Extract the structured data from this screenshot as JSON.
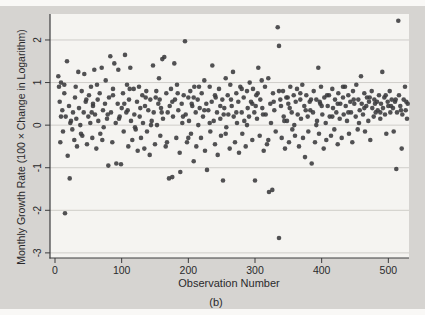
{
  "figure": {
    "caption": "(b)"
  },
  "chart_data": {
    "type": "scatter",
    "title": "",
    "xlabel": "Observation Number",
    "ylabel": "Monthly Growth Rate (100 × Change in Logarithm)",
    "xlim": [
      -7.5,
      531
    ],
    "ylim": [
      -3.12,
      2.61
    ],
    "xticks": [
      0,
      100,
      200,
      300,
      400,
      500
    ],
    "yticks": [
      2,
      1,
      0,
      -1,
      -2,
      -3
    ],
    "grid": "horizontal-only",
    "legend_position": "none",
    "marker": "filled-circle",
    "marker_color": "#3a3a3c",
    "axis_color": "#3c3c3e",
    "gridline_color": "#cfcdc9",
    "scan_gray": "#d6d4d1",
    "plot_bg": "#f5f4f1",
    "points": [
      [
        5,
        1.15
      ],
      [
        6,
        0.9
      ],
      [
        8,
        -0.4
      ],
      [
        9,
        1.0
      ],
      [
        11,
        0.35
      ],
      [
        12,
        -0.15
      ],
      [
        14,
        0.95
      ],
      [
        15,
        -2.07
      ],
      [
        16,
        0.2
      ],
      [
        18,
        1.5
      ],
      [
        19,
        -0.72
      ],
      [
        21,
        0.45
      ],
      [
        22,
        -1.25
      ],
      [
        24,
        0.1
      ],
      [
        26,
        -0.1
      ],
      [
        27,
        0.3
      ],
      [
        29,
        -0.35
      ],
      [
        30,
        0.65
      ],
      [
        32,
        0.15
      ],
      [
        33,
        -0.5
      ],
      [
        35,
        1.25
      ],
      [
        36,
        0.4
      ],
      [
        38,
        0.0
      ],
      [
        40,
        0.8
      ],
      [
        41,
        -0.25
      ],
      [
        43,
        0.3
      ],
      [
        44,
        1.2
      ],
      [
        46,
        0.55
      ],
      [
        48,
        -0.45
      ],
      [
        50,
        0.2
      ],
      [
        51,
        0.7
      ],
      [
        53,
        0.05
      ],
      [
        54,
        0.9
      ],
      [
        56,
        -0.3
      ],
      [
        57,
        0.45
      ],
      [
        59,
        1.3
      ],
      [
        60,
        0.25
      ],
      [
        62,
        -0.55
      ],
      [
        64,
        0.6
      ],
      [
        65,
        0.1
      ],
      [
        67,
        0.75
      ],
      [
        68,
        -0.2
      ],
      [
        70,
        1.35
      ],
      [
        72,
        0.35
      ],
      [
        73,
        -0.05
      ],
      [
        75,
        0.5
      ],
      [
        76,
        1.05
      ],
      [
        78,
        0.15
      ],
      [
        80,
        -0.95
      ],
      [
        81,
        0.65
      ],
      [
        83,
        1.62
      ],
      [
        84,
        0.3
      ],
      [
        86,
        -0.4
      ],
      [
        87,
        0.85
      ],
      [
        89,
        1.45
      ],
      [
        91,
        0.05
      ],
      [
        92,
        -0.9
      ],
      [
        94,
        0.5
      ],
      [
        95,
        1.3
      ],
      [
        97,
        0.2
      ],
      [
        99,
        -0.92
      ],
      [
        100,
        0.4
      ],
      [
        102,
        0.75
      ],
      [
        103,
        -0.15
      ],
      [
        105,
        1.65
      ],
      [
        107,
        0.3
      ],
      [
        108,
        0.95
      ],
      [
        110,
        -0.5
      ],
      [
        111,
        0.6
      ],
      [
        113,
        1.35
      ],
      [
        114,
        0.1
      ],
      [
        116,
        -0.35
      ],
      [
        118,
        0.85
      ],
      [
        119,
        0.25
      ],
      [
        121,
        -0.1
      ],
      [
        123,
        0.55
      ],
      [
        124,
        -0.6
      ],
      [
        126,
        0.9
      ],
      [
        127,
        0.2
      ],
      [
        129,
        -0.3
      ],
      [
        131,
        0.7
      ],
      [
        132,
        0.05
      ],
      [
        134,
        -0.55
      ],
      [
        135,
        0.45
      ],
      [
        137,
        0.8
      ],
      [
        138,
        -0.15
      ],
      [
        140,
        0.35
      ],
      [
        142,
        -0.7
      ],
      [
        143,
        0.6
      ],
      [
        145,
        0.1
      ],
      [
        147,
        1.4
      ],
      [
        148,
        0.3
      ],
      [
        150,
        -0.45
      ],
      [
        151,
        0.65
      ],
      [
        153,
        0.0
      ],
      [
        155,
        0.5
      ],
      [
        156,
        1.1
      ],
      [
        158,
        -0.25
      ],
      [
        159,
        0.4
      ],
      [
        161,
        1.55
      ],
      [
        162,
        0.15
      ],
      [
        164,
        1.6
      ],
      [
        166,
        -0.5
      ],
      [
        167,
        0.75
      ],
      [
        169,
        0.3
      ],
      [
        171,
        -1.25
      ],
      [
        172,
        0.45
      ],
      [
        174,
        0.85
      ],
      [
        176,
        -1.22
      ],
      [
        177,
        0.2
      ],
      [
        179,
        1.45
      ],
      [
        180,
        0.6
      ],
      [
        182,
        -0.3
      ],
      [
        183,
        0.95
      ],
      [
        185,
        0.35
      ],
      [
        187,
        -0.65
      ],
      [
        188,
        -1.1
      ],
      [
        190,
        0.5
      ],
      [
        191,
        0.05
      ],
      [
        193,
        0.7
      ],
      [
        195,
        1.97
      ],
      [
        196,
        0.25
      ],
      [
        198,
        -0.4
      ],
      [
        200,
        0.65
      ],
      [
        201,
        0.1
      ],
      [
        203,
        0.8
      ],
      [
        204,
        -0.2
      ],
      [
        206,
        0.45
      ],
      [
        208,
        -0.85
      ],
      [
        209,
        0.9
      ],
      [
        211,
        0.3
      ],
      [
        212,
        -0.5
      ],
      [
        214,
        0.6
      ],
      [
        215,
        0.0
      ],
      [
        217,
        0.4
      ],
      [
        219,
        -0.3
      ],
      [
        220,
        0.75
      ],
      [
        222,
        0.2
      ],
      [
        224,
        1.05
      ],
      [
        225,
        -0.6
      ],
      [
        227,
        0.5
      ],
      [
        228,
        -1.05
      ],
      [
        230,
        0.35
      ],
      [
        232,
        0.9
      ],
      [
        233,
        -0.15
      ],
      [
        235,
        0.55
      ],
      [
        236,
        1.4
      ],
      [
        238,
        0.1
      ],
      [
        240,
        -0.45
      ],
      [
        241,
        0.65
      ],
      [
        243,
        0.3
      ],
      [
        244,
        -0.7
      ],
      [
        246,
        0.85
      ],
      [
        248,
        0.15
      ],
      [
        249,
        -0.25
      ],
      [
        251,
        0.6
      ],
      [
        252,
        -1.3
      ],
      [
        254,
        0.4
      ],
      [
        256,
        1.1
      ],
      [
        257,
        -0.05
      ],
      [
        259,
        0.7
      ],
      [
        260,
        0.25
      ],
      [
        262,
        -0.55
      ],
      [
        263,
        0.95
      ],
      [
        265,
        0.45
      ],
      [
        267,
        1.25
      ],
      [
        268,
        0.2
      ],
      [
        270,
        -0.4
      ],
      [
        272,
        0.75
      ],
      [
        273,
        0.05
      ],
      [
        275,
        0.55
      ],
      [
        276,
        -0.65
      ],
      [
        278,
        0.9
      ],
      [
        280,
        0.3
      ],
      [
        281,
        -0.2
      ],
      [
        283,
        0.65
      ],
      [
        284,
        0.1
      ],
      [
        286,
        -0.5
      ],
      [
        288,
        0.8
      ],
      [
        289,
        0.4
      ],
      [
        291,
        0.2
      ],
      [
        292,
        1.0
      ],
      [
        294,
        0.55
      ],
      [
        296,
        -0.35
      ],
      [
        297,
        0.85
      ],
      [
        299,
        0.3
      ],
      [
        300,
        -1.3
      ],
      [
        302,
        0.7
      ],
      [
        303,
        0.15
      ],
      [
        305,
        1.35
      ],
      [
        307,
        -0.25
      ],
      [
        308,
        0.6
      ],
      [
        310,
        1.05
      ],
      [
        311,
        0.4
      ],
      [
        313,
        -0.6
      ],
      [
        315,
        0.9
      ],
      [
        316,
        0.25
      ],
      [
        318,
        -0.45
      ],
      [
        320,
        1.1
      ],
      [
        321,
        -1.57
      ],
      [
        323,
        0.5
      ],
      [
        324,
        0.05
      ],
      [
        326,
        -1.52
      ],
      [
        327,
        0.75
      ],
      [
        329,
        0.35
      ],
      [
        331,
        -0.15
      ],
      [
        334,
        2.3
      ],
      [
        336,
        1.86
      ],
      [
        336,
        -2.65
      ],
      [
        338,
        0.6
      ],
      [
        339,
        0.45
      ],
      [
        340,
        -0.3
      ],
      [
        342,
        0.8
      ],
      [
        343,
        0.2
      ],
      [
        345,
        -0.55
      ],
      [
        347,
        0.65
      ],
      [
        348,
        0.1
      ],
      [
        350,
        0.5
      ],
      [
        351,
        -0.4
      ],
      [
        353,
        0.9
      ],
      [
        355,
        0.3
      ],
      [
        356,
        -0.1
      ],
      [
        358,
        0.7
      ],
      [
        359,
        0.0
      ],
      [
        361,
        0.55
      ],
      [
        363,
        0.85
      ],
      [
        364,
        0.25
      ],
      [
        366,
        -0.5
      ],
      [
        368,
        0.6
      ],
      [
        369,
        0.15
      ],
      [
        371,
        0.95
      ],
      [
        372,
        -0.3
      ],
      [
        374,
        0.45
      ],
      [
        375,
        -0.75
      ],
      [
        377,
        0.7
      ],
      [
        379,
        0.2
      ],
      [
        380,
        -0.15
      ],
      [
        382,
        0.55
      ],
      [
        383,
        0.35
      ],
      [
        385,
        -0.9
      ],
      [
        387,
        0.3
      ],
      [
        388,
        0.8
      ],
      [
        390,
        -0.4
      ],
      [
        392,
        0.6
      ],
      [
        393,
        0.1
      ],
      [
        395,
        1.35
      ],
      [
        396,
        -0.2
      ],
      [
        398,
        0.5
      ],
      [
        399,
        0.9
      ],
      [
        401,
        0.25
      ],
      [
        403,
        -0.55
      ],
      [
        404,
        0.65
      ],
      [
        406,
        0.05
      ],
      [
        407,
        -0.35
      ],
      [
        409,
        0.45
      ],
      [
        411,
        0.7
      ],
      [
        412,
        0.2
      ],
      [
        414,
        -0.25
      ],
      [
        416,
        0.85
      ],
      [
        417,
        0.4
      ],
      [
        419,
        -0.1
      ],
      [
        420,
        0.6
      ],
      [
        422,
        0.3
      ],
      [
        424,
        -0.45
      ],
      [
        425,
        0.75
      ],
      [
        427,
        0.15
      ],
      [
        428,
        0.5
      ],
      [
        430,
        -0.3
      ],
      [
        432,
        0.65
      ],
      [
        433,
        0.25
      ],
      [
        435,
        0.9
      ],
      [
        436,
        0.45
      ],
      [
        438,
        0.1
      ],
      [
        440,
        0.7
      ],
      [
        441,
        -0.2
      ],
      [
        443,
        0.55
      ],
      [
        444,
        0.3
      ],
      [
        446,
        -0.4
      ],
      [
        447,
        0.8
      ],
      [
        449,
        0.5
      ],
      [
        451,
        0.2
      ],
      [
        452,
        0.95
      ],
      [
        454,
        -0.1
      ],
      [
        455,
        0.6
      ],
      [
        457,
        0.35
      ],
      [
        459,
        1.15
      ],
      [
        460,
        0.5
      ],
      [
        462,
        0.25
      ],
      [
        464,
        0.75
      ],
      [
        465,
        -0.15
      ],
      [
        467,
        0.45
      ],
      [
        468,
        0.65
      ],
      [
        470,
        0.1
      ],
      [
        471,
        0.55
      ],
      [
        473,
        -0.35
      ],
      [
        475,
        0.8
      ],
      [
        476,
        0.4
      ],
      [
        478,
        0.2
      ],
      [
        479,
        0.6
      ],
      [
        481,
        0.3
      ],
      [
        483,
        0.55
      ],
      [
        484,
        0.35
      ],
      [
        486,
        0.7
      ],
      [
        488,
        0.15
      ],
      [
        489,
        0.5
      ],
      [
        491,
        1.25
      ],
      [
        492,
        0.4
      ],
      [
        494,
        0.65
      ],
      [
        495,
        0.25
      ],
      [
        497,
        -0.2
      ],
      [
        499,
        0.55
      ],
      [
        500,
        0.45
      ],
      [
        502,
        0.8
      ],
      [
        503,
        0.3
      ],
      [
        505,
        0.6
      ],
      [
        507,
        0.4
      ],
      [
        508,
        -0.15
      ],
      [
        510,
        0.55
      ],
      [
        512,
        -1.03
      ],
      [
        513,
        0.3
      ],
      [
        515,
        2.45
      ],
      [
        516,
        0.7
      ],
      [
        518,
        0.45
      ],
      [
        520,
        -0.55
      ],
      [
        521,
        0.25
      ],
      [
        523,
        0.6
      ],
      [
        525,
        0.9
      ],
      [
        526,
        0.35
      ],
      [
        528,
        0.15
      ],
      [
        529,
        0.5
      ],
      [
        7,
        0.55
      ],
      [
        14,
        0.75
      ],
      [
        23,
        0.05
      ],
      [
        31,
        0.9
      ],
      [
        39,
        -0.2
      ],
      [
        47,
        0.6
      ],
      [
        55,
        0.3
      ],
      [
        63,
        0.95
      ],
      [
        71,
        -0.35
      ],
      [
        79,
        0.25
      ],
      [
        87,
        0.7
      ],
      [
        96,
        0.15
      ],
      [
        104,
        0.5
      ],
      [
        112,
        0.85
      ],
      [
        120,
        -0.05
      ],
      [
        128,
        0.4
      ],
      [
        136,
        0.65
      ],
      [
        144,
        0.0
      ],
      [
        152,
        0.8
      ],
      [
        160,
        0.3
      ],
      [
        168,
        -0.4
      ],
      [
        176,
        0.55
      ],
      [
        184,
        0.75
      ],
      [
        192,
        0.2
      ],
      [
        200,
        -0.3
      ],
      [
        208,
        0.65
      ],
      [
        216,
        0.9
      ],
      [
        224,
        0.35
      ],
      [
        232,
        0.05
      ],
      [
        240,
        0.7
      ],
      [
        248,
        0.45
      ],
      [
        256,
        -0.2
      ],
      [
        264,
        0.6
      ],
      [
        272,
        0.3
      ],
      [
        280,
        0.85
      ],
      [
        288,
        0.0
      ],
      [
        296,
        0.5
      ],
      [
        304,
        0.75
      ],
      [
        312,
        0.25
      ],
      [
        320,
        -0.35
      ],
      [
        328,
        0.55
      ],
      [
        336,
        0.8
      ],
      [
        344,
        0.1
      ],
      [
        352,
        0.4
      ],
      [
        360,
        -0.25
      ],
      [
        368,
        0.75
      ],
      [
        376,
        0.35
      ],
      [
        384,
        0.6
      ],
      [
        392,
        0.0
      ],
      [
        400,
        0.45
      ],
      [
        408,
        0.7
      ],
      [
        416,
        0.2
      ],
      [
        424,
        0.5
      ],
      [
        432,
        0.9
      ],
      [
        440,
        0.3
      ],
      [
        448,
        0.6
      ],
      [
        456,
        0.05
      ],
      [
        464,
        0.4
      ],
      [
        472,
        0.65
      ],
      [
        480,
        0.5
      ],
      [
        488,
        0.3
      ],
      [
        496,
        0.7
      ],
      [
        504,
        0.45
      ],
      [
        511,
        0.6
      ],
      [
        519,
        0.35
      ],
      [
        527,
        0.55
      ],
      [
        9,
        0.2
      ],
      [
        57,
        0.5
      ],
      [
        109,
        0.35
      ],
      [
        157,
        0.6
      ],
      [
        205,
        0.5
      ],
      [
        253,
        0.25
      ],
      [
        301,
        0.45
      ],
      [
        349,
        0.65
      ],
      [
        397,
        0.55
      ]
    ]
  }
}
